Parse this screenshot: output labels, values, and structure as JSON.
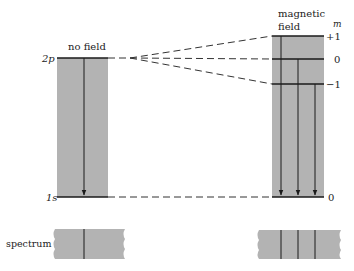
{
  "diagram": {
    "left_title": "no field",
    "right_title_line1": "magnetic",
    "right_title_line2": "field",
    "m_header": "m",
    "level_2p": "2p",
    "level_1s": "1s",
    "m_plus1": "+1",
    "m_zero_upper": "0",
    "m_minus1": "−1",
    "m_zero_lower": "0",
    "spectrum_label": "spectrum",
    "colors": {
      "box_fill": "#b3b3b3",
      "line": "#1a1a1a",
      "background": "#ffffff"
    }
  }
}
